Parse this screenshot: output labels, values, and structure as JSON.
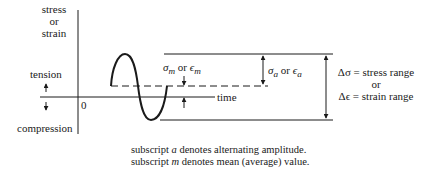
{
  "axis": {
    "y_label_line1": "stress",
    "y_label_line2": "or",
    "y_label_line3": "strain",
    "x_label": "time",
    "origin_label": "0",
    "up_label": "tension",
    "down_label": "compression"
  },
  "annotations": {
    "mean_symbol": "σ",
    "mean_sub": "m",
    "mean_or": " or ",
    "mean_symbol2": "ϵ",
    "mean_sub2": "m",
    "amp_symbol": "σ",
    "amp_sub": "a",
    "amp_or": " or ",
    "amp_symbol2": "ϵ",
    "amp_sub2": "a",
    "range_line1": "Δσ = stress range",
    "range_line2": "or",
    "range_line3": "Δϵ = strain range"
  },
  "caption": {
    "line1_pre": "subscript ",
    "line1_var": "a",
    "line1_post": " denotes alternating amplitude.",
    "line2_pre": "subscript ",
    "line2_var": "m",
    "line2_post": " denotes mean (average) value."
  },
  "colors": {
    "ink": "#1a1a1a",
    "background": "#ffffff"
  }
}
